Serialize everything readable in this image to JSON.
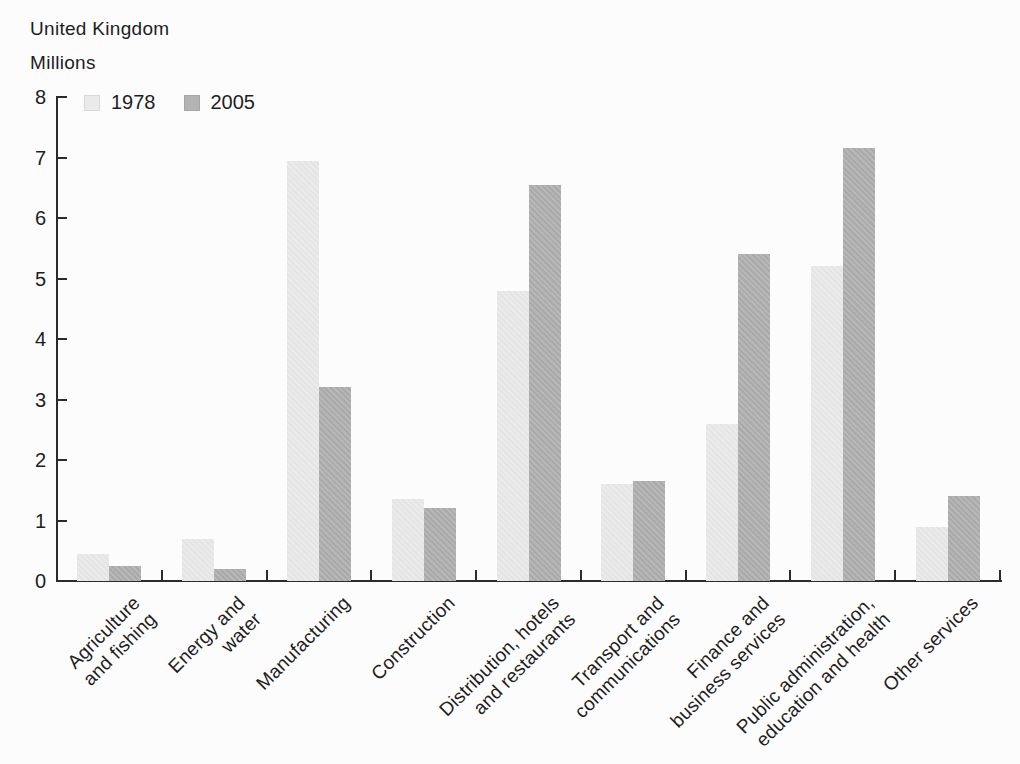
{
  "colors": {
    "background": "#fcfcfc",
    "axis": "#2b2b2b",
    "text": "#1e1e1e"
  },
  "chart_data": {
    "type": "bar",
    "title": "United Kingdom",
    "ylabel": "Millions",
    "xlabel": "",
    "ylim": [
      0,
      8
    ],
    "yticks": [
      0,
      1,
      2,
      3,
      4,
      5,
      6,
      7,
      8
    ],
    "grid": false,
    "legend_position": "top-left-inside",
    "categories": [
      "Agriculture and fishing",
      "Energy and water",
      "Manufacturing",
      "Construction",
      "Distribution, hotels and restaurants",
      "Transport and communications",
      "Finance and business services",
      "Public administration, education and health",
      "Other services"
    ],
    "category_display_lines": [
      [
        "Agriculture",
        "and fishing"
      ],
      [
        "Energy and",
        "water"
      ],
      [
        "Manufacturing"
      ],
      [
        "Construction"
      ],
      [
        "Distribution, hotels",
        "and restaurants"
      ],
      [
        "Transport and",
        "communications"
      ],
      [
        "Finance and",
        "business services"
      ],
      [
        "Public administration,",
        "education and health"
      ],
      [
        "Other services"
      ]
    ],
    "series": [
      {
        "name": "1978",
        "color": "#eaeaea",
        "values": [
          0.45,
          0.7,
          6.95,
          1.35,
          4.8,
          1.6,
          2.6,
          5.2,
          0.9
        ]
      },
      {
        "name": "2005",
        "color": "#b3b3b3",
        "values": [
          0.25,
          0.2,
          3.2,
          1.2,
          6.55,
          1.65,
          5.4,
          7.15,
          1.4
        ]
      }
    ]
  }
}
